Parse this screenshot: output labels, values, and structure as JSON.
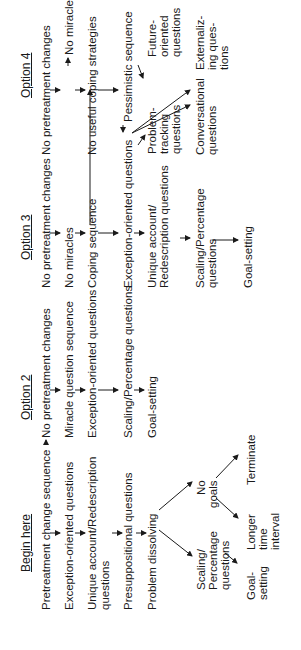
{
  "diagram": {
    "orientation": "rotated -90deg",
    "columns": [
      {
        "header": "Begin here",
        "items": [
          "Pretreatment change sequence",
          "Exception-oriented questions",
          "Unique account/Redescription questions",
          "Presuppositional questions",
          "Problem dissolving"
        ],
        "branches": {
          "scaling": "Scaling/ Percentage questions",
          "goal_setting": "Goal- setting",
          "no_goals": "No goals",
          "longer": "Longer time interval",
          "terminate": "Terminate"
        }
      },
      {
        "header": "Option 2",
        "items": [
          "No pretreatment changes",
          "Miracle question sequence",
          "Exception-oriented questions",
          "Scaling/Percentage questions",
          "Goal-setting"
        ]
      },
      {
        "header": "Option 3",
        "items": [
          "No pretreatment changes",
          "No miracles",
          "Coping sequence",
          "Exception-oriented questions",
          "Unique account/ Redescription questions",
          "Scaling/Percentage questions",
          "Goal-setting"
        ]
      },
      {
        "header": "Option 4",
        "items": [
          "No pretreatment changes",
          "No miracles",
          "No useful coping strategies",
          "Pessimistic sequence"
        ],
        "branches": {
          "problem_tracking": "Problem- tracking questions",
          "future_oriented": "Future- oriented questions",
          "conversational": "Conversational questions",
          "externalizing": "Externaliz- ing ques- tions"
        }
      }
    ]
  },
  "text": {
    "c1_header": "Begin here",
    "c1_i1": "Pretreatment change sequence",
    "c1_i2": "Exception-oriented questions",
    "c1_i3a": "Unique account/Redescription",
    "c1_i3b": "questions",
    "c1_i4": "Presuppositional questions",
    "c1_i5": "Problem dissolving",
    "c1_scal_a": "Scaling/",
    "c1_scal_b": "Percentage",
    "c1_scal_c": "questions",
    "c1_goal_a": "Goal-",
    "c1_goal_b": "setting",
    "c1_nog_a": "No",
    "c1_nog_b": "goals",
    "c1_long_a": "Longer",
    "c1_long_b": "time",
    "c1_long_c": "interval",
    "c1_term": "Terminate",
    "c2_header": "Option 2",
    "c2_i1": "No pretreatment changes",
    "c2_i2": "Miracle question sequence",
    "c2_i3": "Exception-oriented questions",
    "c2_i4": "Scaling/Percentage questions",
    "c2_i5": "Goal-setting",
    "c3_header": "Option 3",
    "c3_i1": "No pretreatment changes",
    "c3_i2": "No miracles",
    "c3_i3": "Coping sequence",
    "c3_i4": "Exception-oriented questions",
    "c3_i5a": "Unique account/",
    "c3_i5b": "Redescription questions",
    "c3_i6a": "Scaling/Percentage",
    "c3_i6b": "questions",
    "c3_i7": "Goal-setting",
    "c4_header": "Option 4",
    "c4_i1": "No pretreatment changes",
    "c4_i2": "No miracles",
    "c4_i3": "No useful coping strategies",
    "c4_i4": "Pessimistic sequence",
    "c4_pt_a": "Problem-",
    "c4_pt_b": "tracking",
    "c4_pt_c": "questions",
    "c4_fo_a": "Future-",
    "c4_fo_b": "oriented",
    "c4_fo_c": "questions",
    "c4_conv_a": "Conversational",
    "c4_conv_b": "questions",
    "c4_ext_a": "Externaliz-",
    "c4_ext_b": "ing ques-",
    "c4_ext_c": "tions"
  }
}
